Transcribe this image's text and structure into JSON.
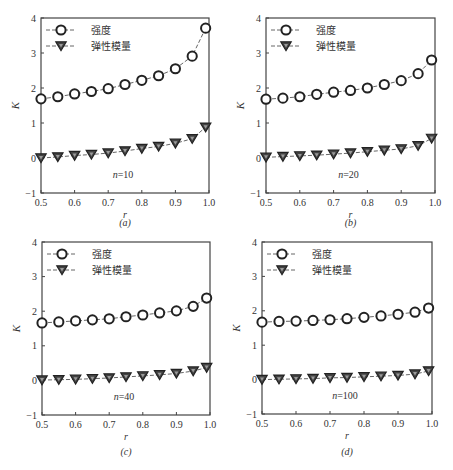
{
  "figure": {
    "x_values": [
      0.5,
      0.55,
      0.6,
      0.65,
      0.7,
      0.75,
      0.8,
      0.85,
      0.9,
      0.95,
      0.99
    ],
    "legend": {
      "strength": "强度",
      "modulus": "弹性模量"
    },
    "ylabel": "K",
    "xlabel": "r",
    "x_ticks": [
      "0.5",
      "0.6",
      "0.7",
      "0.8",
      "0.9",
      "1.0"
    ],
    "y_ticks": [
      "−1",
      "0",
      "1",
      "2",
      "3",
      "4"
    ]
  },
  "chart_data": [
    {
      "type": "line",
      "panel": "(a)",
      "annotation": "n=10",
      "n_prefix": "n",
      "n_value": "=10",
      "caption": "(a)",
      "xlabel": "r",
      "ylabel": "K",
      "xlim": [
        0.5,
        1.0
      ],
      "ylim": [
        -1,
        4
      ],
      "grid": false,
      "legend_position": "upper left",
      "x": [
        0.5,
        0.55,
        0.6,
        0.65,
        0.7,
        0.75,
        0.8,
        0.85,
        0.9,
        0.95,
        0.99
      ],
      "series": [
        {
          "name": "强度",
          "marker": "circle-open",
          "values": [
            1.69,
            1.75,
            1.83,
            1.9,
            1.98,
            2.1,
            2.22,
            2.35,
            2.55,
            2.91,
            3.71
          ]
        },
        {
          "name": "弹性模量",
          "marker": "triangle-down-filled",
          "values": [
            0.0,
            0.03,
            0.07,
            0.1,
            0.14,
            0.2,
            0.27,
            0.33,
            0.42,
            0.55,
            0.88
          ]
        }
      ]
    },
    {
      "type": "line",
      "panel": "(b)",
      "annotation": "n=20",
      "n_prefix": "n",
      "n_value": "=20",
      "caption": "(b)",
      "xlabel": "r",
      "ylabel": "K",
      "xlim": [
        0.5,
        1.0
      ],
      "ylim": [
        -1,
        4
      ],
      "grid": false,
      "legend_position": "upper left",
      "x": [
        0.5,
        0.55,
        0.6,
        0.65,
        0.7,
        0.75,
        0.8,
        0.85,
        0.9,
        0.95,
        0.99
      ],
      "series": [
        {
          "name": "强度",
          "marker": "circle-open",
          "values": [
            1.68,
            1.71,
            1.75,
            1.82,
            1.88,
            1.93,
            2.0,
            2.1,
            2.21,
            2.41,
            2.8
          ]
        },
        {
          "name": "弹性模量",
          "marker": "triangle-down-filled",
          "values": [
            0.02,
            0.04,
            0.06,
            0.08,
            0.11,
            0.14,
            0.18,
            0.22,
            0.26,
            0.35,
            0.56
          ]
        }
      ]
    },
    {
      "type": "line",
      "panel": "(c)",
      "annotation": "n=40",
      "n_prefix": "n",
      "n_value": "=40",
      "caption": "(c)",
      "xlabel": "r",
      "ylabel": "K",
      "xlim": [
        0.5,
        1.0
      ],
      "ylim": [
        -1,
        4
      ],
      "grid": false,
      "legend_position": "upper left",
      "x": [
        0.5,
        0.55,
        0.6,
        0.65,
        0.7,
        0.75,
        0.8,
        0.85,
        0.9,
        0.95,
        0.99
      ],
      "series": [
        {
          "name": "强度",
          "marker": "circle-open",
          "values": [
            1.66,
            1.69,
            1.72,
            1.75,
            1.78,
            1.84,
            1.89,
            1.95,
            2.01,
            2.14,
            2.38
          ]
        },
        {
          "name": "弹性模量",
          "marker": "triangle-down-filled",
          "values": [
            0.01,
            0.02,
            0.03,
            0.05,
            0.07,
            0.1,
            0.13,
            0.16,
            0.2,
            0.27,
            0.37
          ]
        }
      ]
    },
    {
      "type": "line",
      "panel": "(d)",
      "annotation": "n=100",
      "n_prefix": "n",
      "n_value": "=100",
      "caption": "(d)",
      "xlabel": "r",
      "ylabel": "K",
      "xlim": [
        0.5,
        1.0
      ],
      "ylim": [
        -1,
        4
      ],
      "grid": false,
      "legend_position": "upper left",
      "x": [
        0.5,
        0.55,
        0.6,
        0.65,
        0.7,
        0.75,
        0.8,
        0.85,
        0.9,
        0.95,
        0.99
      ],
      "series": [
        {
          "name": "强度",
          "marker": "circle-open",
          "values": [
            1.67,
            1.69,
            1.7,
            1.72,
            1.74,
            1.77,
            1.81,
            1.85,
            1.9,
            1.96,
            2.08
          ]
        },
        {
          "name": "弹性模量",
          "marker": "triangle-down-filled",
          "values": [
            0.0,
            0.01,
            0.02,
            0.03,
            0.05,
            0.06,
            0.08,
            0.1,
            0.12,
            0.16,
            0.25
          ]
        }
      ]
    }
  ],
  "layout": {
    "panels": [
      {
        "left": 41,
        "top": 18,
        "right": 209,
        "bottom": 193,
        "caption_y": 226
      },
      {
        "left": 266,
        "top": 18,
        "right": 435,
        "bottom": 193,
        "caption_y": 226
      },
      {
        "left": 42,
        "top": 242,
        "right": 210,
        "bottom": 415,
        "caption_y": 455
      },
      {
        "left": 262,
        "top": 242,
        "right": 432,
        "bottom": 414,
        "caption_y": 455
      }
    ],
    "colors": {
      "axis": "#444444",
      "line": "#555555",
      "marker_edge": "#222222",
      "marker_fill": "#444444",
      "triangle_inner": "#9a9a9a"
    }
  }
}
